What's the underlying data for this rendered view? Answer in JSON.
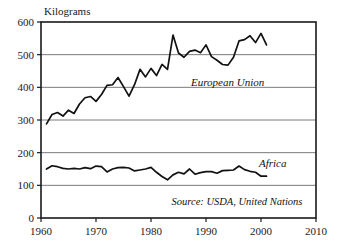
{
  "chart_data": {
    "type": "line",
    "title": "",
    "xlabel": "",
    "ylabel": "Kilograms",
    "xlim": [
      1960,
      2010
    ],
    "ylim": [
      0,
      600
    ],
    "xticks": [
      1960,
      1970,
      1980,
      1990,
      2000,
      2010
    ],
    "yticks": [
      0,
      100,
      200,
      300,
      400,
      500,
      600
    ],
    "grid": "horizontal",
    "legend_position": "inline-annotation",
    "annotations": [
      "European Union",
      "Africa",
      "Source: USDA, United Nations"
    ],
    "source": "Source: USDA, United Nations",
    "x": [
      1961,
      1962,
      1963,
      1964,
      1965,
      1966,
      1967,
      1968,
      1969,
      1970,
      1971,
      1972,
      1973,
      1974,
      1975,
      1976,
      1977,
      1978,
      1979,
      1980,
      1981,
      1982,
      1983,
      1984,
      1985,
      1986,
      1987,
      1988,
      1989,
      1990,
      1991,
      1992,
      1993,
      1994,
      1995,
      1996,
      1997,
      1998,
      1999,
      2000,
      2001
    ],
    "series": [
      {
        "name": "European Union",
        "values": [
          288,
          317,
          323,
          312,
          330,
          320,
          349,
          368,
          372,
          357,
          378,
          406,
          408,
          430,
          402,
          373,
          408,
          455,
          432,
          458,
          436,
          470,
          455,
          560,
          505,
          492,
          510,
          514,
          506,
          530,
          494,
          483,
          470,
          468,
          492,
          542,
          546,
          558,
          537,
          565,
          530
        ]
      },
      {
        "name": "Africa",
        "values": [
          150,
          160,
          157,
          152,
          150,
          152,
          150,
          154,
          151,
          159,
          157,
          141,
          150,
          154,
          155,
          153,
          144,
          147,
          150,
          155,
          140,
          127,
          117,
          132,
          140,
          135,
          150,
          134,
          139,
          142,
          142,
          137,
          145,
          146,
          147,
          159,
          148,
          143,
          140,
          128,
          128
        ]
      }
    ]
  },
  "labels": {
    "y_axis_title": "Kilograms",
    "series_eu": "European Union",
    "series_africa": "Africa",
    "source_note": "Source: USDA, United Nations"
  }
}
